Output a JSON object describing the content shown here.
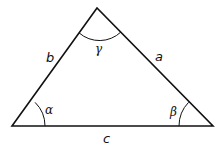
{
  "diagram": {
    "title": "",
    "type": "triangle",
    "sides": {
      "a": "a",
      "b": "b",
      "c": "c"
    },
    "angles": {
      "alpha": "α",
      "beta": "β",
      "gamma": "γ"
    },
    "colors": {
      "stroke": "#111111",
      "background": "#ffffff"
    }
  }
}
